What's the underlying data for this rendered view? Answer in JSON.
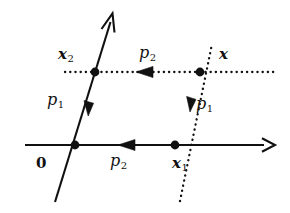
{
  "figure": {
    "kind": "lattice-vector-diagram",
    "width": 290,
    "height": 213,
    "background": "#ffffff",
    "ink": "#111111"
  },
  "labels": {
    "x2": {
      "base": "x",
      "sub": "2",
      "role": "lattice-point-x2"
    },
    "x": {
      "base": "x",
      "sub": "",
      "role": "lattice-point-x"
    },
    "x1": {
      "base": "x",
      "sub": "1",
      "role": "lattice-point-x1"
    },
    "zero": {
      "base": "0",
      "sub": "",
      "role": "origin"
    },
    "p1_left": {
      "base": "p",
      "sub": "1",
      "role": "vector-p1-solid"
    },
    "p1_right": {
      "base": "p",
      "sub": "1",
      "role": "vector-p1-dotted"
    },
    "p2_top": {
      "base": "p",
      "sub": "2",
      "role": "vector-p2-dotted"
    },
    "p2_bottom": {
      "base": "p",
      "sub": "2",
      "role": "vector-p2-solid"
    }
  },
  "geometry": {
    "solid_horizontal_axis": {
      "from": [
        25,
        145
      ],
      "to": [
        275,
        145
      ],
      "style": "solid",
      "end_arrow": "right",
      "mid_arrow": {
        "at": [
          122,
          145
        ],
        "direction": "left"
      }
    },
    "solid_diagonal_line": {
      "from": [
        55,
        202
      ],
      "to": [
        113,
        14
      ],
      "style": "solid",
      "end_arrow": "up",
      "mid_arrow": {
        "at": [
          89,
          110
        ],
        "direction": "down"
      }
    },
    "dotted_horizontal_line": {
      "from": [
        65,
        72
      ],
      "to": [
        277,
        72
      ],
      "style": "dotted",
      "end_arrow": "none",
      "mid_arrow": {
        "at": [
          142,
          72
        ],
        "direction": "left"
      }
    },
    "dotted_diagonal_line": {
      "from": [
        180,
        201
      ],
      "to": [
        212,
        44
      ],
      "style": "dotted",
      "end_arrow": "none",
      "mid_arrow": {
        "at": [
          191,
          106
        ],
        "direction": "down"
      }
    },
    "points": [
      {
        "name": "origin",
        "at": [
          75,
          145
        ],
        "radius": 4.2
      },
      {
        "name": "x2",
        "at": [
          95,
          72
        ],
        "radius": 4.2
      },
      {
        "name": "x",
        "at": [
          200,
          72
        ],
        "radius": 4.2
      },
      {
        "name": "x1",
        "at": [
          175,
          145
        ],
        "radius": 4.2
      }
    ]
  }
}
